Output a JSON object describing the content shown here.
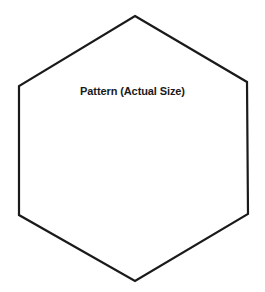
{
  "diagram": {
    "title": "Pattern (Actual Size)",
    "shape": "hexagon",
    "stroke_color": "#1a1a1a",
    "fill_color": "#ffffff",
    "vertices": [
      [
        135,
        16
      ],
      [
        247,
        82
      ],
      [
        248,
        214
      ],
      [
        135,
        281
      ],
      [
        19,
        215
      ],
      [
        19,
        86
      ]
    ]
  }
}
